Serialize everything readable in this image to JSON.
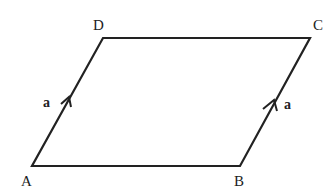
{
  "diagram": {
    "type": "parallelogram",
    "vertices": {
      "A": {
        "label": "A",
        "x": 32,
        "y": 166
      },
      "B": {
        "label": "B",
        "x": 240,
        "y": 166
      },
      "C": {
        "label": "C",
        "x": 310,
        "y": 38
      },
      "D": {
        "label": "D",
        "x": 103,
        "y": 38
      }
    },
    "edges": [
      {
        "from": "A",
        "to": "B"
      },
      {
        "from": "B",
        "to": "C",
        "vector_label": "a",
        "arrow": true
      },
      {
        "from": "C",
        "to": "D"
      },
      {
        "from": "D",
        "to": "A",
        "vector_label": "a",
        "arrow": true
      }
    ],
    "vector_labels": {
      "left": "a",
      "right": "a"
    },
    "line_color": "#222222"
  }
}
